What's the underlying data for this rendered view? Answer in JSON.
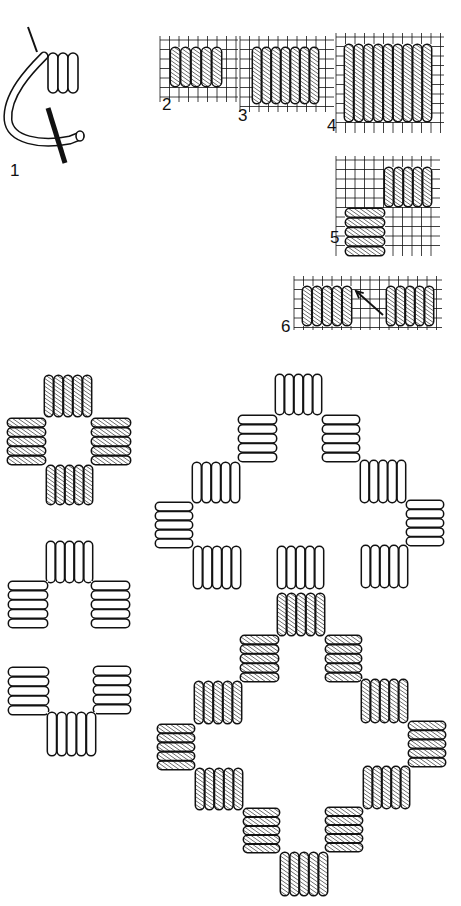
{
  "figure": {
    "background": "#ffffff",
    "ink": "#111111",
    "hatch_color": "#222222"
  },
  "labels": [
    {
      "id": "1",
      "text": "1",
      "x": 10,
      "y": 162
    },
    {
      "id": "2",
      "text": "2",
      "x": 162,
      "y": 96
    },
    {
      "id": "3",
      "text": "3",
      "x": 238,
      "y": 107
    },
    {
      "id": "4",
      "text": "4",
      "x": 327,
      "y": 117
    },
    {
      "id": "5",
      "text": "5",
      "x": 330,
      "y": 229
    },
    {
      "id": "6",
      "text": "6",
      "x": 281,
      "y": 318
    }
  ],
  "diagrams": {
    "d1": {
      "description": "needle wrapping thread coils"
    },
    "d2": {
      "grid": {
        "x": 160,
        "y": 36,
        "w": 78,
        "h": 66,
        "step": 9.5
      },
      "blocks": [
        {
          "x": 170,
          "y": 47,
          "w": 52,
          "h": 40,
          "n": 5,
          "dir": "v",
          "hatch": true
        }
      ]
    },
    "d3": {
      "grid": {
        "x": 240,
        "y": 36,
        "w": 94,
        "h": 76,
        "step": 9.5
      },
      "blocks": [
        {
          "x": 252,
          "y": 47,
          "w": 67,
          "h": 57,
          "n": 7,
          "dir": "v",
          "hatch": true
        }
      ]
    },
    "d4": {
      "grid": {
        "x": 336,
        "y": 33,
        "w": 108,
        "h": 100,
        "step": 9.5
      },
      "blocks": [
        {
          "x": 344,
          "y": 44,
          "w": 88,
          "h": 78,
          "n": 9,
          "dir": "v",
          "hatch": true
        }
      ]
    },
    "d5": {
      "grid": {
        "x": 336,
        "y": 156,
        "w": 104,
        "h": 100,
        "step": 9.5
      },
      "blocks": [
        {
          "x": 384,
          "y": 167,
          "w": 48,
          "h": 40,
          "n": 5,
          "dir": "v",
          "hatch": true
        },
        {
          "x": 345,
          "y": 208,
          "w": 40,
          "h": 48,
          "n": 5,
          "dir": "h",
          "hatch": true
        }
      ]
    },
    "d6": {
      "grid": {
        "x": 294,
        "y": 276,
        "w": 148,
        "h": 54,
        "step": 9.5
      },
      "blocks": [
        {
          "x": 302,
          "y": 286,
          "w": 50,
          "h": 40,
          "n": 5,
          "dir": "v",
          "hatch": true
        },
        {
          "x": 386,
          "y": 286,
          "w": 48,
          "h": 40,
          "n": 5,
          "dir": "v",
          "hatch": true
        }
      ],
      "arrow": {
        "x1": 383,
        "y1": 315,
        "x2": 356,
        "y2": 291
      }
    }
  },
  "motifs": {
    "small_cross": [
      {
        "x": 44,
        "y": 375,
        "w": 48,
        "h": 42,
        "n": 5,
        "dir": "v",
        "hatch": true
      },
      {
        "x": 7,
        "y": 418,
        "w": 39,
        "h": 47,
        "n": 5,
        "dir": "h",
        "hatch": true
      },
      {
        "x": 91,
        "y": 418,
        "w": 40,
        "h": 47,
        "n": 5,
        "dir": "h",
        "hatch": true
      },
      {
        "x": 46,
        "y": 465,
        "w": 47,
        "h": 40,
        "n": 5,
        "dir": "v",
        "hatch": true
      }
    ],
    "small_arch": [
      {
        "x": 46,
        "y": 541,
        "w": 47,
        "h": 42,
        "n": 5,
        "dir": "v",
        "hatch": false
      },
      {
        "x": 8,
        "y": 581,
        "w": 40,
        "h": 47,
        "n": 5,
        "dir": "h",
        "hatch": false
      },
      {
        "x": 91,
        "y": 581,
        "w": 39,
        "h": 47,
        "n": 5,
        "dir": "h",
        "hatch": false
      }
    ],
    "small_u": [
      {
        "x": 8,
        "y": 667,
        "w": 41,
        "h": 48,
        "n": 5,
        "dir": "h",
        "hatch": false
      },
      {
        "x": 93,
        "y": 666,
        "w": 38,
        "h": 48,
        "n": 5,
        "dir": "h",
        "hatch": false
      },
      {
        "x": 47,
        "y": 712,
        "w": 49,
        "h": 44,
        "n": 5,
        "dir": "v",
        "hatch": false
      }
    ],
    "large_outline": [
      {
        "x": 275,
        "y": 374,
        "w": 47,
        "h": 41,
        "n": 5,
        "dir": "v",
        "hatch": false
      },
      {
        "x": 238,
        "y": 415,
        "w": 39,
        "h": 47,
        "n": 5,
        "dir": "h",
        "hatch": false
      },
      {
        "x": 322,
        "y": 415,
        "w": 38,
        "h": 47,
        "n": 5,
        "dir": "h",
        "hatch": false
      },
      {
        "x": 192,
        "y": 462,
        "w": 48,
        "h": 41,
        "n": 5,
        "dir": "v",
        "hatch": false
      },
      {
        "x": 360,
        "y": 460,
        "w": 46,
        "h": 43,
        "n": 5,
        "dir": "v",
        "hatch": false
      },
      {
        "x": 155,
        "y": 502,
        "w": 38,
        "h": 46,
        "n": 5,
        "dir": "h",
        "hatch": false
      },
      {
        "x": 406,
        "y": 500,
        "w": 38,
        "h": 46,
        "n": 5,
        "dir": "h",
        "hatch": false
      },
      {
        "x": 193,
        "y": 546,
        "w": 48,
        "h": 43,
        "n": 5,
        "dir": "v",
        "hatch": false
      },
      {
        "x": 277,
        "y": 546,
        "w": 47,
        "h": 43,
        "n": 5,
        "dir": "v",
        "hatch": false
      },
      {
        "x": 361,
        "y": 545,
        "w": 47,
        "h": 43,
        "n": 5,
        "dir": "v",
        "hatch": false
      }
    ],
    "large_hatched": [
      {
        "x": 277,
        "y": 593,
        "w": 48,
        "h": 43,
        "n": 5,
        "dir": "v",
        "hatch": true
      },
      {
        "x": 240,
        "y": 635,
        "w": 39,
        "h": 47,
        "n": 5,
        "dir": "h",
        "hatch": true
      },
      {
        "x": 325,
        "y": 635,
        "w": 37,
        "h": 47,
        "n": 5,
        "dir": "h",
        "hatch": true
      },
      {
        "x": 194,
        "y": 681,
        "w": 48,
        "h": 43,
        "n": 5,
        "dir": "v",
        "hatch": true
      },
      {
        "x": 361,
        "y": 679,
        "w": 47,
        "h": 44,
        "n": 5,
        "dir": "v",
        "hatch": true
      },
      {
        "x": 157,
        "y": 724,
        "w": 38,
        "h": 46,
        "n": 5,
        "dir": "h",
        "hatch": true
      },
      {
        "x": 408,
        "y": 721,
        "w": 38,
        "h": 46,
        "n": 5,
        "dir": "h",
        "hatch": true
      },
      {
        "x": 195,
        "y": 768,
        "w": 48,
        "h": 42,
        "n": 5,
        "dir": "v",
        "hatch": true
      },
      {
        "x": 363,
        "y": 766,
        "w": 47,
        "h": 43,
        "n": 5,
        "dir": "v",
        "hatch": true
      },
      {
        "x": 243,
        "y": 808,
        "w": 37,
        "h": 45,
        "n": 5,
        "dir": "h",
        "hatch": true
      },
      {
        "x": 325,
        "y": 807,
        "w": 38,
        "h": 45,
        "n": 5,
        "dir": "h",
        "hatch": true
      },
      {
        "x": 280,
        "y": 852,
        "w": 48,
        "h": 44,
        "n": 5,
        "dir": "v",
        "hatch": true
      }
    ]
  }
}
